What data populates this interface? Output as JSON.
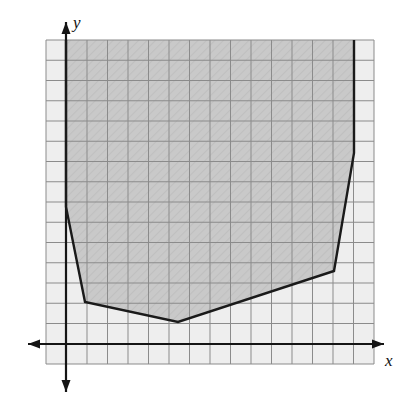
{
  "figure": {
    "type": "coordinate-grid-diagram",
    "title": "",
    "background_color": "#ffffff"
  },
  "axes": {
    "x_label": "x",
    "y_label": "y",
    "x_axis_color": "#1a1a1a",
    "y_axis_color": "#1a1a1a",
    "x_axis_has_arrows_both_ends": true,
    "y_axis_has_arrows_both_ends": true,
    "origin_px": [
      66,
      344
    ]
  },
  "grid": {
    "color": "#8f8f8f",
    "cell_size_px": 20.5,
    "columns": 16,
    "rows": 16,
    "left_px": 46,
    "top_px": 40,
    "right_px": 374,
    "bottom_px": 364,
    "fill_color": "#eeeeee"
  },
  "shaded_region": {
    "name": "shaded-polygon",
    "fill_color": "#c9c9c9",
    "fill_opacity": 0.85,
    "border_color": "#1a1a1a",
    "border_width_px": 2.4,
    "closed_at_top": false,
    "vertices_px": [
      [
        66,
        40
      ],
      [
        66,
        207
      ],
      [
        85,
        302
      ],
      [
        178,
        322
      ],
      [
        334,
        271
      ],
      [
        354,
        153
      ],
      [
        354,
        40
      ]
    ],
    "vertices_grid_units": [
      [
        0,
        14.8
      ],
      [
        0,
        6.7
      ],
      [
        0.9,
        2.0
      ],
      [
        5.5,
        1.1
      ],
      [
        13.1,
        3.6
      ],
      [
        14.0,
        9.3
      ],
      [
        14.0,
        14.8
      ]
    ]
  },
  "chart_data": {
    "type": "area",
    "title": "",
    "xlabel": "x",
    "ylabel": "y",
    "grid": true,
    "legend": "none",
    "xlim": [
      -1,
      15
    ],
    "ylim": [
      -1,
      15
    ],
    "x": [
      0,
      0.9,
      5.5,
      13.1,
      14.0
    ],
    "series": [
      {
        "name": "boundary",
        "values": [
          6.7,
          2.0,
          1.1,
          3.6,
          9.3
        ]
      }
    ],
    "annotations": [
      "Region bounded below by a piecewise-linear boundary and extending upward beyond the top of the grid",
      "Left boundary is the vertical segment along the y-axis from y=6.7 upward",
      "Right boundary is the vertical segment at x=14 from y=9.3 upward"
    ]
  }
}
